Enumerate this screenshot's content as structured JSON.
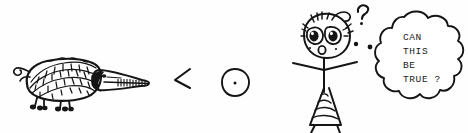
{
  "scene": {
    "title": "Hand-drawn cartoon comparison sketch",
    "width": 468,
    "height": 133,
    "background_color": "#fefefe",
    "ink_color": "#151515"
  },
  "creature": {
    "name": "pangolin",
    "description": "scaly armored anteater-like animal with long snout, tongue, curled tail and four stubby legs",
    "label": "pangolin-drawing"
  },
  "comparison": {
    "operator": "<",
    "operator_name": "less-than-sign"
  },
  "dot_circle": {
    "name": "circle-with-center-dot",
    "description": "small open circle containing a single center dot"
  },
  "figure": {
    "name": "astonished-stick-figure",
    "question_mark": "?"
  },
  "thought_bubble": {
    "name": "thought-bubble",
    "lines": [
      "CAN",
      "THIS",
      "BE",
      "TRUE  ?"
    ],
    "full_text": "CAN THIS BE TRUE ?",
    "tail_dots": 2
  }
}
